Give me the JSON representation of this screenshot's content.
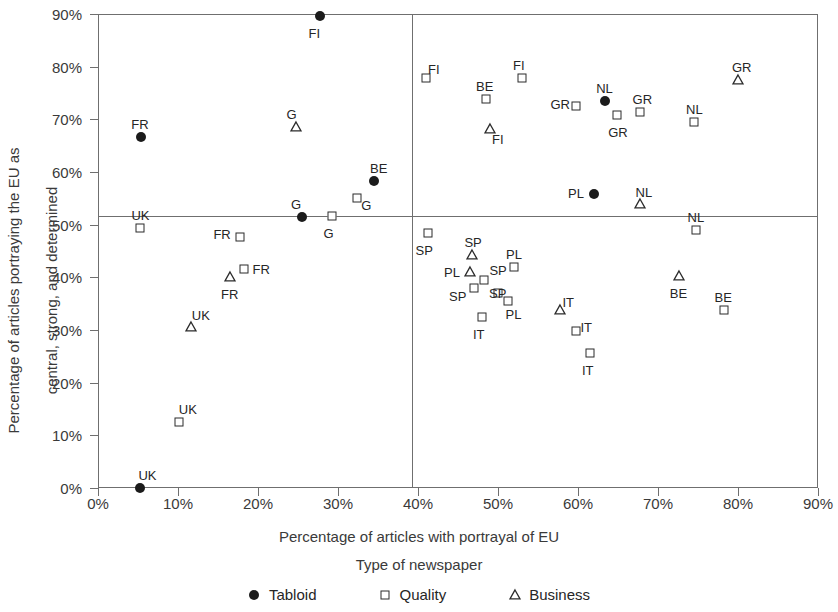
{
  "chart_data": {
    "type": "scatter",
    "title": "",
    "xlabel": "Percentage of articles with portrayal of EU",
    "ylabel": "Percentage of articles portraying the EU as central, strong, and determined",
    "ylabel_line1": "Percentage of articles portraying the EU as",
    "ylabel_line2": "central, strong, and determined",
    "legend_title": "Type of newspaper",
    "legend_position": "bottom",
    "grid": false,
    "xlim": [
      0,
      90
    ],
    "ylim": [
      0,
      90
    ],
    "xticks": [
      "0%",
      "10%",
      "20%",
      "30%",
      "40%",
      "50%",
      "60%",
      "70%",
      "80%",
      "90%"
    ],
    "xtick_values": [
      0,
      10,
      20,
      30,
      40,
      50,
      60,
      70,
      80,
      90
    ],
    "yticks": [
      "0%",
      "10%",
      "20%",
      "30%",
      "40%",
      "50%",
      "60%",
      "70%",
      "80%",
      "90%"
    ],
    "ytick_values": [
      0,
      10,
      20,
      30,
      40,
      50,
      60,
      70,
      80,
      90
    ],
    "reference_lines": {
      "horizontal": 51,
      "vertical": 40
    },
    "series": [
      {
        "name": "Tabloid",
        "marker": "filled-circle",
        "color": "#1b1b1b"
      },
      {
        "name": "Quality",
        "marker": "open-square",
        "color": "#2b2b2b"
      },
      {
        "name": "Business",
        "marker": "open-triangle",
        "color": "#2b2b2b"
      }
    ],
    "points": [
      {
        "country": "FI",
        "series": "Tabloid",
        "x": 27.7,
        "y": 89.7,
        "label_dx": -2,
        "label_dy": 17
      },
      {
        "country": "FR",
        "series": "Tabloid",
        "x": 5.4,
        "y": 66.6,
        "label_dx": -1,
        "label_dy": -13
      },
      {
        "country": "G",
        "series": "Business",
        "x": 24.7,
        "y": 68.6,
        "label_dx": 0,
        "label_dy": -13
      },
      {
        "country": "BE",
        "series": "Tabloid",
        "x": 34.5,
        "y": 58.2,
        "label_dx": 5,
        "label_dy": -13
      },
      {
        "country": "G",
        "series": "Quality",
        "x": 32.4,
        "y": 55.0,
        "label_dx": 13,
        "label_dy": 7
      },
      {
        "country": "G",
        "series": "Tabloid",
        "x": 25.5,
        "y": 51.5,
        "label_dx": -2,
        "label_dy": -13
      },
      {
        "country": "G",
        "series": "Quality",
        "x": 29.3,
        "y": 51.7,
        "label_dx": 0,
        "label_dy": 17
      },
      {
        "country": "UK",
        "series": "Quality",
        "x": 5.3,
        "y": 49.3,
        "label_dx": 0,
        "label_dy": -13
      },
      {
        "country": "FR",
        "series": "Quality",
        "x": 17.8,
        "y": 47.7,
        "label_dx": -18,
        "label_dy": -3
      },
      {
        "country": "FR",
        "series": "Quality",
        "x": 18.2,
        "y": 41.5,
        "label_dx": 18,
        "label_dy": 0
      },
      {
        "country": "FR",
        "series": "Business",
        "x": 16.5,
        "y": 40.0,
        "label_dx": 0,
        "label_dy": 17
      },
      {
        "country": "UK",
        "series": "Business",
        "x": 11.6,
        "y": 30.6,
        "label_dx": 10,
        "label_dy": -12
      },
      {
        "country": "UK",
        "series": "Quality",
        "x": 10.1,
        "y": 12.6,
        "label_dx": 9,
        "label_dy": -13
      },
      {
        "country": "UK",
        "series": "Tabloid",
        "x": 5.3,
        "y": 0.0,
        "label_dx": 7,
        "label_dy": -13
      },
      {
        "country": "FI",
        "series": "Quality",
        "x": 41.0,
        "y": 77.9,
        "label_dx": 11,
        "label_dy": -9
      },
      {
        "country": "FI",
        "series": "Quality",
        "x": 53.0,
        "y": 77.9,
        "label_dx": 0,
        "label_dy": -13
      },
      {
        "country": "BE",
        "series": "Quality",
        "x": 48.5,
        "y": 73.8,
        "label_dx": -1,
        "label_dy": -13
      },
      {
        "country": "FI",
        "series": "Business",
        "x": 49.0,
        "y": 68.2,
        "label_dx": 11,
        "label_dy": 10
      },
      {
        "country": "GR",
        "series": "Quality",
        "x": 59.8,
        "y": 72.5,
        "label_dx": -17,
        "label_dy": -2
      },
      {
        "country": "NL",
        "series": "Tabloid",
        "x": 63.4,
        "y": 73.4,
        "label_dx": 0,
        "label_dy": -13
      },
      {
        "country": "GR",
        "series": "Quality",
        "x": 64.9,
        "y": 70.8,
        "label_dx": 0,
        "label_dy": 17
      },
      {
        "country": "GR",
        "series": "Quality",
        "x": 67.7,
        "y": 71.3,
        "label_dx": 2,
        "label_dy": -13
      },
      {
        "country": "NL",
        "series": "Quality",
        "x": 74.5,
        "y": 69.5,
        "label_dx": 1,
        "label_dy": -13
      },
      {
        "country": "GR",
        "series": "Business",
        "x": 80.0,
        "y": 77.4,
        "label_dx": 3,
        "label_dy": -13
      },
      {
        "country": "PL",
        "series": "Tabloid",
        "x": 62.0,
        "y": 55.8,
        "label_dx": -17,
        "label_dy": -1
      },
      {
        "country": "NL",
        "series": "Business",
        "x": 67.7,
        "y": 54.0,
        "label_dx": 5,
        "label_dy": -12
      },
      {
        "country": "NL",
        "series": "Quality",
        "x": 74.7,
        "y": 49.0,
        "label_dx": 1,
        "label_dy": -13
      },
      {
        "country": "SP",
        "series": "Quality",
        "x": 41.2,
        "y": 48.4,
        "label_dx": -3,
        "label_dy": 17
      },
      {
        "country": "SP",
        "series": "Business",
        "x": 46.8,
        "y": 44.3,
        "label_dx": 1,
        "label_dy": -13
      },
      {
        "country": "PL",
        "series": "Business",
        "x": 46.5,
        "y": 41.1,
        "label_dx": -17,
        "label_dy": 0
      },
      {
        "country": "SP",
        "series": "Quality",
        "x": 48.3,
        "y": 39.5,
        "label_dx": 14,
        "label_dy": -10
      },
      {
        "country": "SP",
        "series": "Quality",
        "x": 47.0,
        "y": 38.0,
        "label_dx": -16,
        "label_dy": 8
      },
      {
        "country": "SP",
        "series": "Quality",
        "x": 50.0,
        "y": 37.0,
        "label_dx": 0,
        "label_dy": 0
      },
      {
        "country": "PL",
        "series": "Quality",
        "x": 52.0,
        "y": 42.0,
        "label_dx": 1,
        "label_dy": -13
      },
      {
        "country": "PL",
        "series": "Quality",
        "x": 51.2,
        "y": 35.6,
        "label_dx": 7,
        "label_dy": 13
      },
      {
        "country": "IT",
        "series": "Quality",
        "x": 48.0,
        "y": 32.5,
        "label_dx": 0,
        "label_dy": 17
      },
      {
        "country": "IT",
        "series": "Business",
        "x": 57.8,
        "y": 33.8,
        "label_dx": 11,
        "label_dy": -8
      },
      {
        "country": "IT",
        "series": "Quality",
        "x": 59.8,
        "y": 29.8,
        "label_dx": 13,
        "label_dy": -4
      },
      {
        "country": "IT",
        "series": "Quality",
        "x": 61.5,
        "y": 25.6,
        "label_dx": 1,
        "label_dy": 17
      },
      {
        "country": "BE",
        "series": "Business",
        "x": 72.6,
        "y": 40.3,
        "label_dx": 0,
        "label_dy": 17
      },
      {
        "country": "BE",
        "series": "Quality",
        "x": 78.2,
        "y": 33.8,
        "label_dx": 0,
        "label_dy": -13
      }
    ]
  }
}
